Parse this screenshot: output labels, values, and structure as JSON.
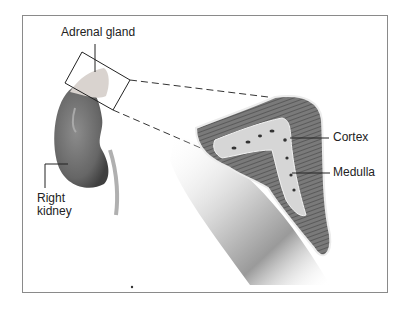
{
  "diagram": {
    "labels": {
      "adrenal_gland": "Adrenal gland",
      "right_kidney_line1": "Right",
      "right_kidney_line2": "kidney",
      "cortex": "Cortex",
      "medulla": "Medulla"
    },
    "colors": {
      "frame": "#8a8a8a",
      "kidney": "#6e6e6e",
      "cortex": "#7d7d7d",
      "medulla": "#d8d8d8",
      "leader_line": "#222222"
    }
  }
}
